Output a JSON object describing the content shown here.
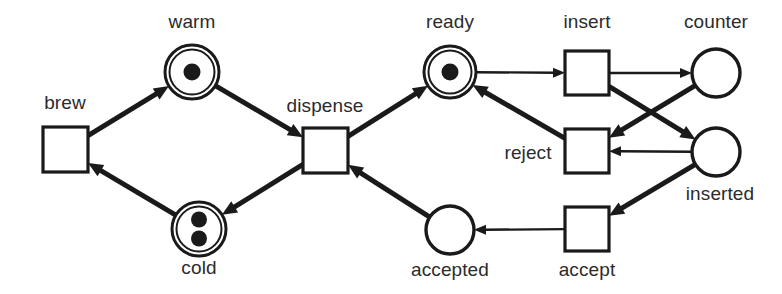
{
  "figure": {
    "type": "petri-net",
    "width": 782,
    "height": 294,
    "background_color": "#ffffff",
    "stroke_color": "#1a1a1a",
    "text_color": "#2b2b2b",
    "token_color": "#1a1a1a"
  },
  "places": [
    {
      "id": "warm",
      "label": "warm",
      "cx": 192,
      "cy": 72,
      "r": 27,
      "double_ring": true,
      "tokens": 1,
      "label_x": 192,
      "label_y": 12,
      "label_align": "center"
    },
    {
      "id": "cold",
      "label": "cold",
      "cx": 199,
      "cy": 229,
      "r": 27,
      "double_ring": true,
      "tokens": 2,
      "label_x": 199,
      "label_y": 258,
      "label_align": "center"
    },
    {
      "id": "ready",
      "label": "ready",
      "cx": 450,
      "cy": 72,
      "r": 26,
      "double_ring": true,
      "tokens": 1,
      "label_x": 450,
      "label_y": 12,
      "label_align": "center"
    },
    {
      "id": "counter",
      "label": "counter",
      "cx": 716,
      "cy": 73,
      "r": 24,
      "double_ring": false,
      "tokens": 0,
      "label_x": 716,
      "label_y": 12,
      "label_align": "center"
    },
    {
      "id": "inserted",
      "label": "inserted",
      "cx": 716,
      "cy": 152,
      "r": 24,
      "double_ring": false,
      "tokens": 0,
      "label_x": 720,
      "label_y": 184,
      "label_align": "center"
    },
    {
      "id": "accepted",
      "label": "accepted",
      "cx": 450,
      "cy": 230,
      "r": 24,
      "double_ring": false,
      "tokens": 0,
      "label_x": 450,
      "label_y": 260,
      "label_align": "center"
    }
  ],
  "transitions": [
    {
      "id": "brew",
      "label": "brew",
      "x": 43,
      "y": 127,
      "w": 45,
      "h": 45,
      "label_x": 65,
      "label_y": 93,
      "label_align": "center"
    },
    {
      "id": "dispense",
      "label": "dispense",
      "x": 303,
      "y": 128,
      "w": 45,
      "h": 45,
      "label_x": 325,
      "label_y": 96,
      "label_align": "center"
    },
    {
      "id": "insert",
      "label": "insert",
      "x": 565,
      "y": 51,
      "w": 44,
      "h": 44,
      "label_x": 587,
      "label_y": 12,
      "label_align": "center"
    },
    {
      "id": "reject",
      "label": "reject",
      "x": 565,
      "y": 129,
      "w": 44,
      "h": 44,
      "label_x": 528,
      "label_y": 143,
      "label_align": "center"
    },
    {
      "id": "accept",
      "label": "accept",
      "x": 565,
      "y": 207,
      "w": 44,
      "h": 44,
      "label_x": 587,
      "label_y": 260,
      "label_align": "center"
    }
  ],
  "arcs": [
    {
      "id": "brew-to-warm",
      "from": "brew",
      "to": "warm",
      "weight": "thick"
    },
    {
      "id": "warm-to-dispense",
      "from": "warm",
      "to": "dispense",
      "weight": "thick"
    },
    {
      "id": "dispense-to-cold",
      "from": "dispense",
      "to": "cold",
      "weight": "thick"
    },
    {
      "id": "cold-to-brew",
      "from": "cold",
      "to": "brew",
      "weight": "thick"
    },
    {
      "id": "dispense-to-ready",
      "from": "dispense",
      "to": "ready",
      "weight": "thick"
    },
    {
      "id": "accepted-to-dispense",
      "from": "accepted",
      "to": "dispense",
      "weight": "thick"
    },
    {
      "id": "ready-to-insert",
      "from": "ready",
      "to": "insert",
      "weight": "thin"
    },
    {
      "id": "insert-to-counter",
      "from": "insert",
      "to": "counter",
      "weight": "thin"
    },
    {
      "id": "insert-to-inserted",
      "from": "insert",
      "to": "inserted",
      "weight": "thick"
    },
    {
      "id": "counter-to-reject",
      "from": "counter",
      "to": "reject",
      "weight": "thick"
    },
    {
      "id": "inserted-to-reject",
      "from": "inserted",
      "to": "reject",
      "weight": "thin"
    },
    {
      "id": "reject-to-ready",
      "from": "reject",
      "to": "ready",
      "weight": "thick"
    },
    {
      "id": "inserted-to-accept",
      "from": "inserted",
      "to": "accept",
      "weight": "thick"
    },
    {
      "id": "accept-to-accepted",
      "from": "accept",
      "to": "accepted",
      "weight": "thin"
    }
  ]
}
